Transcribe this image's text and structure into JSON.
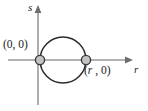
{
  "figure": {
    "background_color": "#ffffff",
    "width": 148,
    "height": 111
  },
  "axes": {
    "horizontal": {
      "name": "r-axis",
      "label": "r",
      "color": "#9a9a9a",
      "start_x": 8,
      "end_x": 133,
      "y": 60,
      "arrow": "right"
    },
    "vertical": {
      "name": "s-axis",
      "label": "s",
      "color": "#9a9a9a",
      "x": 38,
      "start_y": 105,
      "end_y": 6,
      "arrow": "up"
    }
  },
  "curve": {
    "type": "circle",
    "color": "#2b2b2b",
    "center": {
      "r": 63,
      "s": 60
    },
    "radius": 23,
    "description": "circle tangent-free passing through (0,0) and (r,0)"
  },
  "points": [
    {
      "id": "origin",
      "label": "(0, 0)",
      "marker_color": "#c3c3c3",
      "marker_stroke": "#3a3a3a",
      "x": 40,
      "y": 60,
      "label_position": "left"
    },
    {
      "id": "point-r",
      "label": "(r , 0)",
      "label_italic_part": "r",
      "label_plain_part": " , 0",
      "marker_color": "#c3c3c3",
      "marker_stroke": "#3a3a3a",
      "x": 86,
      "y": 60,
      "label_position": "below-right"
    }
  ],
  "labels": {
    "origin_text": "(0, 0)",
    "point_r_open": "(",
    "point_r_italic": "r",
    "point_r_rest": " , 0)",
    "axis_s_text": "s",
    "axis_r_text": "r"
  }
}
